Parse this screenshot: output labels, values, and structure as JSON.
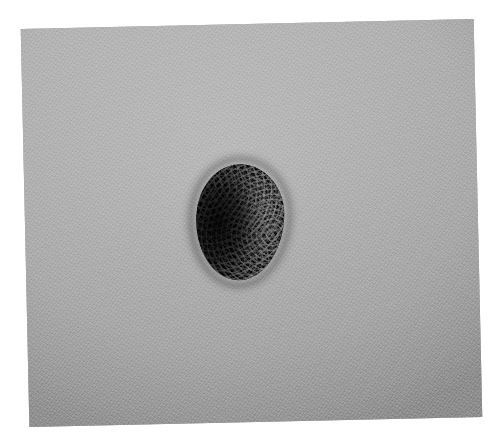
{
  "page": {
    "background_color": "#ffffff",
    "width": 496,
    "height": 445
  },
  "photograph": {
    "name": "clinical-dermatology-photograph",
    "modality": "clinical photograph",
    "color_mode": "grayscale",
    "subject": "pigmented skin lesion",
    "caption": "",
    "frame": {
      "left": 25,
      "top": 24,
      "width": 453,
      "height": 398,
      "rotation_degrees": -1.25
    },
    "background_field": {
      "name": "skin-surface",
      "description": "uniform grey skin with fine grain and faint creases",
      "base_color": "#a9a9a9",
      "highlight_color": "#b6b6b6",
      "shadow_color": "#9a9a9a"
    },
    "lesion": {
      "name": "pigmented-lesion",
      "description": "solitary dark ovoid nodule with granular verrucous surface",
      "shape": "ovoid",
      "color": "#101010",
      "highlight_color": "#b4b4b4",
      "halo_color": "#2e2e2e",
      "bounds": {
        "left": 196,
        "top": 164,
        "width": 88,
        "height": 116
      },
      "surface_texture": "granular / papillomatous speckling, lighter on the right aspect"
    }
  },
  "overlays": {
    "labels": [],
    "scale_bar": null,
    "annotations": []
  }
}
